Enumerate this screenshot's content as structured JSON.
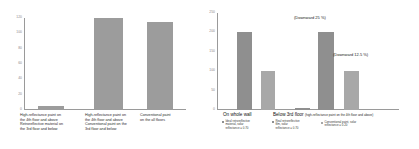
{
  "chart_data": [
    {
      "type": "bar",
      "title": "",
      "xlabel": "",
      "ylabel": "",
      "ylim": [
        0,
        120
      ],
      "yticks": [
        "120",
        "100",
        "80",
        "60",
        "40",
        "20",
        "0"
      ],
      "grid": false,
      "legend": "none",
      "categories": [
        "High-reflectance paint on the 4th floor and above  Retroreflective material on the 3rd floor and below",
        "High-reflectance paint on the 4th floor and above Conventional paint on the 3rd floor and below",
        "Conventional paint on the all floors"
      ],
      "category_lines": [
        [
          "High-reflectance paint on",
          "the 4th floor and above",
          "Retroreflective material on",
          "the 3rd floor and below"
        ],
        [
          "High-reflectance paint on",
          "the 4th floor and above",
          "Conventional paint on the",
          "3rd floor and below"
        ],
        [
          "Conventional paint",
          "on the all floors"
        ]
      ],
      "values": [
        5,
        120,
        115
      ]
    },
    {
      "type": "bar",
      "title": "",
      "xlabel": "",
      "ylabel": "",
      "ylim": [
        0,
        250
      ],
      "yticks": [
        "250",
        "200",
        "150",
        "100",
        "50",
        "0"
      ],
      "grid": false,
      "legend": "below-axis",
      "groups": [
        {
          "name": "On whole wall",
          "name_suffix": "",
          "legend": [
            {
              "lines": [
                "Ideal retroreflective",
                "material, solar",
                "reflectance = 0.70"
              ],
              "color_key": "dark"
            }
          ]
        },
        {
          "name": "Below 3rd floor",
          "name_suffix": "(high-reflectance paint on the 4th floor and above)",
          "legend": [
            {
              "lines": [
                "Real retroreflective",
                "film, solar",
                "reflectance = 0.70"
              ],
              "color_key": "dark"
            },
            {
              "lines": [
                "Conventional paint, solar",
                "reflectance = 0.20"
              ],
              "color_key": "light"
            }
          ]
        }
      ],
      "bars": [
        {
          "value": 200,
          "color_key": "dark",
          "group": "On whole wall"
        },
        {
          "value": 100,
          "color_key": "light",
          "group": "On whole wall"
        },
        {
          "value": 5,
          "color_key": "dark",
          "group": "Below 3rd floor"
        },
        {
          "value": 201,
          "color_key": "dark",
          "group": "Below 3rd floor"
        },
        {
          "value": 101,
          "color_key": "light",
          "group": "Below 3rd floor"
        }
      ],
      "annotations": [
        {
          "text": "(Downward 25 %)"
        },
        {
          "text": "(Downward 12.5 %)"
        }
      ]
    }
  ],
  "colors": {
    "bar_dark": "#8f8f8f",
    "bar_light": "#a8a8a8",
    "axis": "#9a9a9a",
    "tick_text": "#8a8a8a",
    "background": "#ffffff"
  }
}
